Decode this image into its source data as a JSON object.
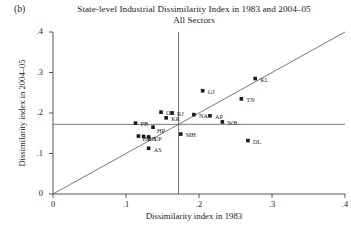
{
  "figure": {
    "panel_tag": "(b)",
    "title_line1": "State-level Industrial Dissimilarity Index in 1983 and 2004–05",
    "title_line2": "All Sectors"
  },
  "axes": {
    "xlabel": "Dissimilarity index in 1983",
    "ylabel": "Dissimilarity index in 2004–05",
    "x_ticks": [
      "0",
      ".1",
      ".2",
      ".3",
      ".4"
    ],
    "y_ticks": [
      "0",
      ".1",
      ".2",
      ".3",
      ".4"
    ]
  },
  "chart_data": {
    "type": "scatter",
    "xlabel": "Dissimilarity index in 1983",
    "ylabel": "Dissimilarity index in 2004–05",
    "xlim": [
      0,
      0.4
    ],
    "ylim": [
      0,
      0.4
    ],
    "xticks": [
      0,
      0.1,
      0.2,
      0.3,
      0.4
    ],
    "yticks": [
      0,
      0.1,
      0.2,
      0.3,
      0.4
    ],
    "xtick_labels": [
      "0",
      ".1",
      ".2",
      ".3",
      ".4"
    ],
    "ytick_labels": [
      "0",
      ".1",
      ".2",
      ".3",
      ".4"
    ],
    "grid": false,
    "legend": false,
    "points": [
      {
        "label": "PB",
        "x": 0.113,
        "y": 0.175,
        "label_dx": 5,
        "label_dy": 1
      },
      {
        "label": "OR",
        "x": 0.148,
        "y": 0.202,
        "label_dx": 5,
        "label_dy": 1
      },
      {
        "label": "RJ",
        "x": 0.163,
        "y": 0.2,
        "label_dx": 5,
        "label_dy": 1
      },
      {
        "label": "KR",
        "x": 0.155,
        "y": 0.188,
        "label_dx": 5,
        "label_dy": 1
      },
      {
        "label": "HP",
        "x": 0.137,
        "y": 0.165,
        "label_dx": 4,
        "label_dy": 4
      },
      {
        "label": "HR",
        "x": 0.117,
        "y": 0.143,
        "label_dx": 4,
        "label_dy": 3
      },
      {
        "label": "BH",
        "x": 0.124,
        "y": 0.142,
        "label_dx": 4,
        "label_dy": 3
      },
      {
        "label": "UP",
        "x": 0.131,
        "y": 0.141,
        "label_dx": 5,
        "label_dy": 2
      },
      {
        "label": "AS",
        "x": 0.131,
        "y": 0.113,
        "label_dx": 5,
        "label_dy": 2
      },
      {
        "label": "MH",
        "x": 0.175,
        "y": 0.148,
        "label_dx": 5,
        "label_dy": 1
      },
      {
        "label": "NA",
        "x": 0.193,
        "y": 0.196,
        "label_dx": 5,
        "label_dy": 1
      },
      {
        "label": "AP",
        "x": 0.215,
        "y": 0.193,
        "label_dx": 5,
        "label_dy": 1
      },
      {
        "label": "WB",
        "x": 0.232,
        "y": 0.178,
        "label_dx": 5,
        "label_dy": 1
      },
      {
        "label": "GJ",
        "x": 0.205,
        "y": 0.255,
        "label_dx": 5,
        "label_dy": 1
      },
      {
        "label": "TN",
        "x": 0.258,
        "y": 0.235,
        "label_dx": 5,
        "label_dy": 1
      },
      {
        "label": "KL",
        "x": 0.277,
        "y": 0.285,
        "label_dx": 5,
        "label_dy": 1
      },
      {
        "label": "DL",
        "x": 0.267,
        "y": 0.132,
        "label_dx": 5,
        "label_dy": 1
      }
    ],
    "reference_lines": [
      {
        "name": "diagonal-45",
        "type": "identity",
        "from": [
          0.0,
          0.0
        ],
        "to": [
          0.4,
          0.4
        ]
      },
      {
        "name": "horizontal-mean",
        "type": "horizontal",
        "value": 0.172
      },
      {
        "name": "vertical-mean",
        "type": "vertical",
        "value": 0.172
      }
    ]
  },
  "style": {
    "marker_color": "#1a1a1a",
    "line_color": "#555555",
    "axis_color": "#444444"
  }
}
